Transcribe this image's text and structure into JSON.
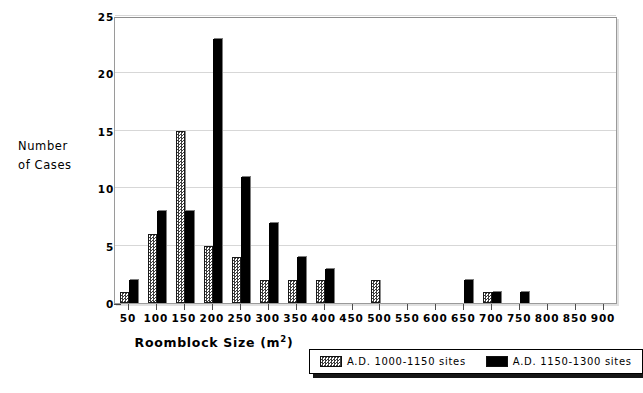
{
  "chart_data": {
    "type": "bar",
    "title": "",
    "subtitle": "",
    "xlabel": "Roomblock Size (m2)",
    "xlabel_base": "Roomblock Size (m",
    "xlabel_sup": "2",
    "xlabel_close": ")",
    "ylabel": "Number of Cases",
    "ylabel_line1": "Number",
    "ylabel_line2": "of Cases",
    "categories": [
      50,
      100,
      150,
      200,
      250,
      300,
      350,
      400,
      450,
      500,
      550,
      600,
      650,
      700,
      750,
      800,
      850,
      900
    ],
    "xtick_labels": [
      "50",
      "100",
      "150",
      "200",
      "250",
      "300",
      "350",
      "400",
      "450",
      "500",
      "550",
      "600",
      "650",
      "700",
      "750",
      "800",
      "850",
      "900"
    ],
    "ytick_labels": [
      "0",
      "5",
      "10",
      "15",
      "20",
      "25"
    ],
    "yticks": [
      0,
      5,
      10,
      15,
      20,
      25
    ],
    "ylim": [
      0,
      25
    ],
    "xlim": [
      25,
      925
    ],
    "grid": true,
    "legend_position": "below-right",
    "series": [
      {
        "name": "A.D. 1000-1150 sites",
        "fill": "stipple",
        "color": "#ffffff",
        "values": [
          1,
          6,
          15,
          5,
          4,
          2,
          2,
          2,
          0,
          2,
          0,
          0,
          0,
          1,
          0,
          0,
          0,
          0
        ]
      },
      {
        "name": "A.D. 1150-1300 sites",
        "fill": "solid",
        "color": "#000000",
        "values": [
          2,
          8,
          8,
          23,
          11,
          7,
          4,
          3,
          0,
          0,
          0,
          0,
          2,
          1,
          1,
          0,
          0,
          0
        ]
      }
    ]
  },
  "legend": {
    "entries": [
      {
        "label": "A.D. 1000-1150 sites",
        "swatch": "stipple-swatch"
      },
      {
        "label": "A.D. 1150-1300 sites",
        "swatch": "solid-black-swatch"
      }
    ]
  },
  "colors": {
    "series_light": "#ffffff",
    "series_dark": "#000000",
    "gridline": "#d7d7d7",
    "frame": "#9a9a9a",
    "text": "#000000",
    "background": "#ffffff"
  }
}
